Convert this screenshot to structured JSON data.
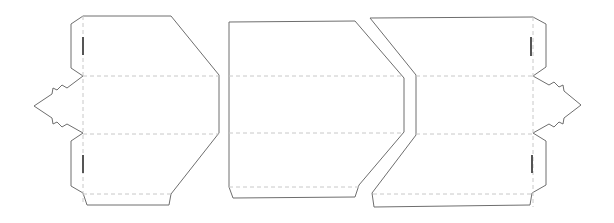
{
  "diagram": {
    "type": "die-cut packaging template",
    "panels": [
      {
        "id": "left-panel",
        "features": [
          "arrow-tab-left",
          "slot-top",
          "slot-bottom"
        ]
      },
      {
        "id": "middle-panel",
        "features": []
      },
      {
        "id": "right-panel",
        "features": [
          "arrow-tab-right",
          "slot-top",
          "slot-bottom"
        ]
      }
    ],
    "line_styles": {
      "cut_line": {
        "color": "#6e6e6e",
        "style": "solid"
      },
      "fold_line": {
        "color": "#c8c8c8",
        "style": "dashed"
      },
      "slot": {
        "color": "#555555",
        "style": "solid-thick"
      }
    },
    "shapes": {
      "left_panel": "83,16 171,16 219,75 219,133 171,194 169,205 87,205 83,193 71,186 71,141 83,133 67,124 62,127 57,122 53,124 52,118 34,106 52,94 53,88 57,90 62,85 67,88 83,76 71,68 71,24",
      "middle_panel": "229,22 355,21 404,78 404,132 359,185 355,197 233,198 229,187",
      "right_panel": "370,18 533,17 546,24 546,67 533,76 549,85 554,82 559,87 563,85 564,91 581,105 564,118 563,124 559,122 554,127 549,124 533,133 546,141 546,185 532,193 530,205 374,207 372,193 416,135 416,75",
      "left_slots": [
        [
          83,
          37,
          83,
          55
        ],
        [
          83,
          155,
          83,
          173
        ]
      ],
      "right_slots": [
        [
          531,
          37,
          531,
          56
        ],
        [
          532,
          155,
          532,
          173
        ]
      ],
      "fold_lines": [
        [
          83,
          76,
          219,
          76
        ],
        [
          83,
          134,
          219,
          134
        ],
        [
          83,
          194,
          171,
          194
        ],
        [
          83,
          16,
          83,
          205
        ],
        [
          229,
          76,
          404,
          76
        ],
        [
          229,
          133,
          404,
          133
        ],
        [
          229,
          187,
          359,
          187
        ],
        [
          416,
          76,
          533,
          76
        ],
        [
          416,
          134,
          533,
          134
        ],
        [
          373,
          194,
          532,
          194
        ],
        [
          533,
          17,
          533,
          207
        ]
      ]
    }
  }
}
